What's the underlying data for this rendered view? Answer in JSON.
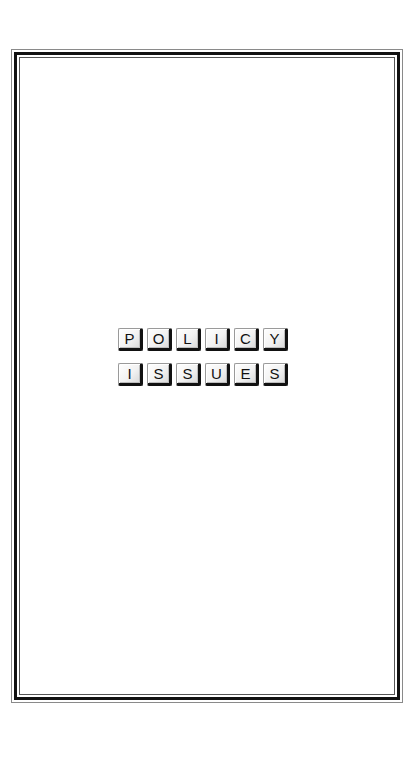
{
  "page": {
    "background": "#ffffff",
    "frame_color": "#111111"
  },
  "title": {
    "line1": [
      "P",
      "O",
      "L",
      "I",
      "C",
      "Y"
    ],
    "line2": [
      "I",
      "S",
      "S",
      "U",
      "E",
      "S"
    ],
    "text": "POLICY ISSUES"
  }
}
